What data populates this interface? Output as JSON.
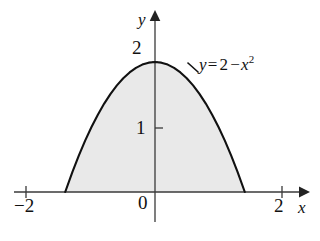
{
  "figure": {
    "kind": "cartesian-plot",
    "background_color": "#ffffff",
    "curve_color": "#111111",
    "axis_color": "#3a3a3a",
    "fill_color": "#e9e9e9"
  },
  "axes": {
    "x_axis_label": "x",
    "y_axis_label": "y",
    "origin_label": "0",
    "x_ticks": [
      {
        "label": "−2",
        "value": -2
      },
      {
        "label": "2",
        "value": 2
      }
    ],
    "y_ticks": [
      {
        "label": "1",
        "value": 1
      },
      {
        "label": "2",
        "value": 2
      }
    ],
    "xlim": [
      -2.45,
      2.45
    ],
    "ylim": [
      -0.75,
      2.55
    ]
  },
  "annotations": {
    "equation_y": "y",
    "equation_eq": "=",
    "equation_rhs_a": "2",
    "equation_minus": "−",
    "equation_var": "x",
    "equation_exp": "2",
    "equation_full": "y = 2 − x²"
  },
  "chart_data": {
    "type": "line",
    "title": "",
    "xlabel": "x",
    "ylabel": "y",
    "xlim": [
      -2.45,
      2.45
    ],
    "ylim": [
      -0.75,
      2.55
    ],
    "grid": false,
    "legend": "none",
    "x_ticks": [
      -2,
      0,
      2
    ],
    "x_ticklabels": [
      "−2",
      "0",
      "2"
    ],
    "y_ticks": [
      1,
      2
    ],
    "y_ticklabels": [
      "1",
      "2"
    ],
    "series": [
      {
        "name": "y = 2 - x^2",
        "formula": "y = 2 - x^2",
        "annotation": "y = 2 − x²",
        "vertex": [
          0,
          2
        ],
        "roots": [
          -1.4142,
          1.4142
        ],
        "fill_between": {
          "from": "curve",
          "to": "y=0",
          "color": "#e9e9e9"
        },
        "x": [
          -1.4142,
          -1.3,
          -1.2,
          -1.1,
          -1.0,
          -0.9,
          -0.8,
          -0.7,
          -0.6,
          -0.5,
          -0.4,
          -0.3,
          -0.2,
          -0.1,
          0.0,
          0.1,
          0.2,
          0.3,
          0.4,
          0.5,
          0.6,
          0.7,
          0.8,
          0.9,
          1.0,
          1.1,
          1.2,
          1.3,
          1.4142
        ],
        "y": [
          0.0,
          0.31,
          0.56,
          0.79,
          1.0,
          1.19,
          1.36,
          1.51,
          1.64,
          1.75,
          1.84,
          1.91,
          1.96,
          1.99,
          2.0,
          1.99,
          1.96,
          1.91,
          1.84,
          1.75,
          1.64,
          1.51,
          1.36,
          1.19,
          1.0,
          0.79,
          0.56,
          0.31,
          0.0
        ]
      }
    ]
  }
}
